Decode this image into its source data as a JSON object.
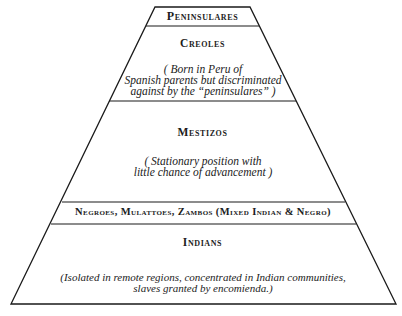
{
  "diagram": {
    "type": "social-pyramid",
    "tiers": [
      {
        "title": "Peninsulares",
        "description": ""
      },
      {
        "title": "Creoles",
        "description_lines": [
          "( Born in Peru of",
          "Spanish parents but discriminated",
          "against by the “peninsulares” )"
        ]
      },
      {
        "title": "Mestizos",
        "description_lines": [
          "( Stationary position with",
          "little chance of advancement )"
        ]
      },
      {
        "title": "Negroes, Mulattoes, Zambos (Mixed Indian & Negro)",
        "description": ""
      },
      {
        "title": "Indians",
        "description_lines": [
          "(Isolated in remote regions, concentrated in Indian communities,",
          "slaves granted by encomienda.)"
        ]
      }
    ]
  }
}
